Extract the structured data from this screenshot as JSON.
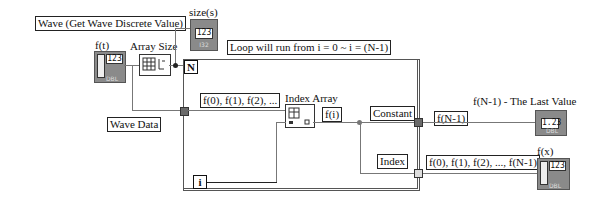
{
  "labels": {
    "wave_title": "Wave (Get Wave Discrete Value)",
    "ft": "f(t)",
    "array_size": "Array Size",
    "size_s": "size(s)",
    "loop_note": "Loop will run from i = 0 ~ i = (N-1)",
    "wave_data": "Wave Data",
    "f_series_partial": "f(0), f(1), f(2), ...",
    "index_array": "Index Array",
    "fi": "f(i)",
    "constant": "Constant",
    "fn1": "f(N-1)",
    "last_value": "f(N-1) - The Last Value",
    "index": "Index",
    "f_series_full": "f(0), f(1), f(2), ..., f(N-1)",
    "fx": "f(x)"
  },
  "terminals": {
    "count": "N",
    "iteration": "i"
  },
  "indicators": {
    "size_value": "123",
    "size_type": "I32",
    "last_value": "1.23",
    "last_type": "DBL",
    "ft_value": "123",
    "ft_type": "DBL",
    "fx_value": "123",
    "fx_type": "DBL"
  },
  "colors": {
    "wire": "#777777",
    "indicator_fill": "#8a8a8a",
    "loop_border": "#555555"
  }
}
